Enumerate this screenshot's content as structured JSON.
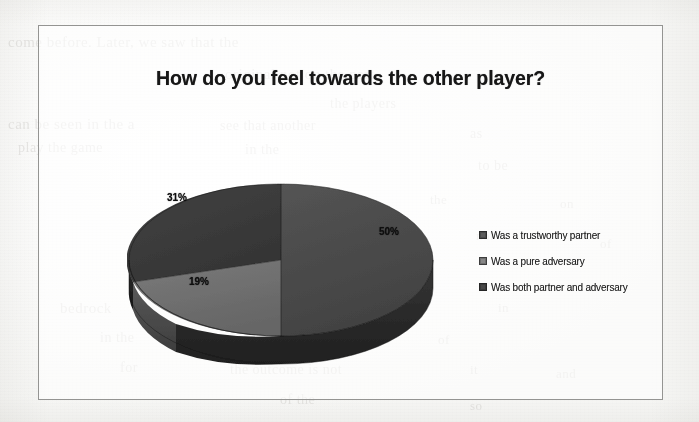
{
  "document": {
    "kind": "scanned-page-figure",
    "ghost_text_lines": [
      {
        "text": "come before. Later, we saw that the",
        "x": 8,
        "y": 34,
        "size": 15
      },
      {
        "text": "original not on the part",
        "x": 225,
        "y": 66,
        "size": 15
      },
      {
        "text": "the players",
        "x": 330,
        "y": 96,
        "size": 14
      },
      {
        "text": "can be seen in the a",
        "x": 8,
        "y": 116,
        "size": 15
      },
      {
        "text": "see that another",
        "x": 220,
        "y": 118,
        "size": 14
      },
      {
        "text": "play the game",
        "x": 18,
        "y": 140,
        "size": 14
      },
      {
        "text": "in the",
        "x": 245,
        "y": 142,
        "size": 14
      },
      {
        "text": "as",
        "x": 470,
        "y": 126,
        "size": 14
      },
      {
        "text": "to be",
        "x": 478,
        "y": 158,
        "size": 14
      },
      {
        "text": "the",
        "x": 430,
        "y": 192,
        "size": 13
      },
      {
        "text": "on",
        "x": 560,
        "y": 196,
        "size": 13
      },
      {
        "text": "nor",
        "x": 476,
        "y": 228,
        "size": 13
      },
      {
        "text": "of",
        "x": 600,
        "y": 236,
        "size": 13
      },
      {
        "text": "bedrock",
        "x": 60,
        "y": 300,
        "size": 15
      },
      {
        "text": "a particular player",
        "x": 200,
        "y": 302,
        "size": 15
      },
      {
        "text": "in",
        "x": 498,
        "y": 300,
        "size": 13
      },
      {
        "text": "of",
        "x": 438,
        "y": 332,
        "size": 13
      },
      {
        "text": "in the",
        "x": 100,
        "y": 330,
        "size": 14
      },
      {
        "text": "own might to play",
        "x": 215,
        "y": 334,
        "size": 15
      },
      {
        "text": "it",
        "x": 470,
        "y": 362,
        "size": 13
      },
      {
        "text": "for",
        "x": 120,
        "y": 360,
        "size": 14
      },
      {
        "text": "the outcome is not",
        "x": 230,
        "y": 362,
        "size": 14
      },
      {
        "text": "and",
        "x": 556,
        "y": 366,
        "size": 13
      },
      {
        "text": "of the",
        "x": 280,
        "y": 392,
        "size": 14
      },
      {
        "text": "so",
        "x": 470,
        "y": 398,
        "size": 13
      }
    ]
  },
  "chart": {
    "title": "How do you feel towards the other player?"
  },
  "legend": {
    "items": [
      {
        "label": "Was a trustworthy partner",
        "color": "#4b4b4b",
        "swatch_name": "legend-swatch-trustworthy"
      },
      {
        "label": "Was a pure adversary",
        "color": "#6f6f6f",
        "swatch_name": "legend-swatch-adversary"
      },
      {
        "label": "Was both partner and adversary",
        "color": "#3a3a3a",
        "swatch_name": "legend-swatch-both"
      }
    ]
  },
  "labels": {
    "a": "50%",
    "b": "31%",
    "c": "19%"
  },
  "chart_data": {
    "type": "pie",
    "title": "How do you feel towards the other player?",
    "xlabel": "",
    "ylabel": "",
    "three_d": true,
    "legend_position": "right",
    "grid": false,
    "categories": [
      "Was a trustworthy partner",
      "Was a pure adversary",
      "Was both partner and adversary"
    ],
    "values": [
      50,
      19,
      31
    ],
    "data_labels": [
      "50%",
      "19%",
      "31%"
    ],
    "units": "percent",
    "slice_colors": [
      "#4b4b4b",
      "#6f6f6f",
      "#3a3a3a"
    ],
    "slice_side_colors": [
      "#2b2b2b",
      "#4a4a4a",
      "#222222"
    ],
    "start_angle_deg": 0,
    "direction": "clockwise"
  }
}
